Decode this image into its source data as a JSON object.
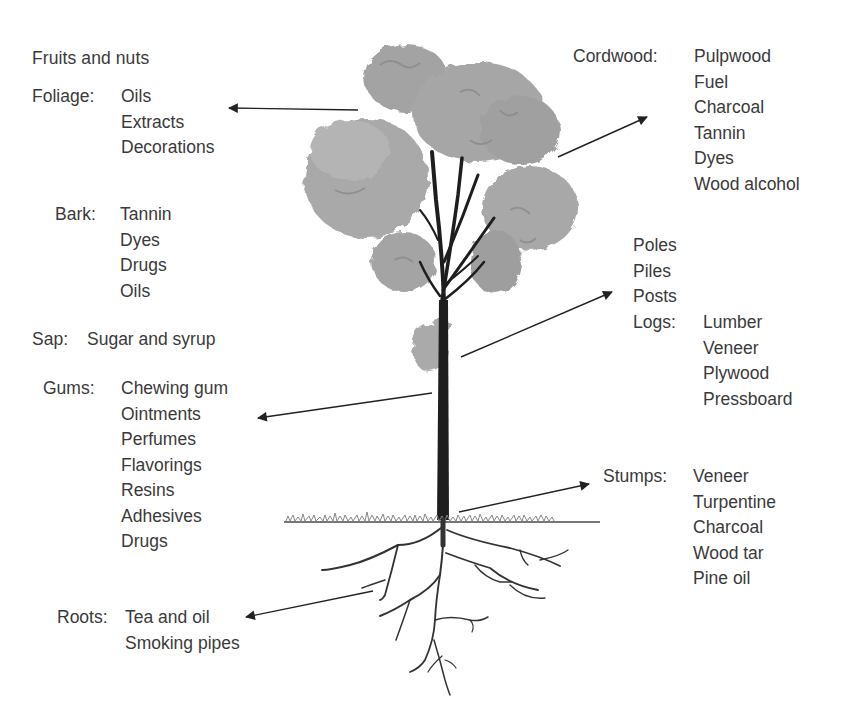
{
  "diagram": {
    "colors": {
      "text": "#3a3a3a",
      "foliage": "#a4a4a4",
      "foliage_dark": "#888888",
      "trunk": "#1e1e1e",
      "grass": "#777777",
      "arrow": "#222222"
    },
    "left": {
      "fruits": {
        "label": "Fruits and nuts"
      },
      "foliage": {
        "label": "Foliage:",
        "items": [
          "Oils",
          "Extracts",
          "Decorations"
        ]
      },
      "bark": {
        "label": "Bark:",
        "items": [
          "Tannin",
          "Dyes",
          "Drugs",
          "Oils"
        ]
      },
      "sap": {
        "label": "Sap:",
        "value": "Sugar and syrup"
      },
      "gums": {
        "label": "Gums:",
        "items": [
          "Chewing gum",
          "Ointments",
          "Perfumes",
          "Flavorings",
          "Resins",
          "Adhesives",
          "Drugs"
        ]
      },
      "roots": {
        "label": "Roots:",
        "items": [
          "Tea and oil",
          "Smoking pipes"
        ]
      }
    },
    "right": {
      "cordwood": {
        "label": "Cordwood:",
        "items": [
          "Pulpwood",
          "Fuel",
          "Charcoal",
          "Tannin",
          "Dyes",
          "Wood alcohol"
        ]
      },
      "trunk_products": {
        "items": [
          "Poles",
          "Piles",
          "Posts"
        ]
      },
      "logs": {
        "label": "Logs:",
        "items": [
          "Lumber",
          "Veneer",
          "Plywood",
          "Pressboard"
        ]
      },
      "stumps": {
        "label": "Stumps:",
        "items": [
          "Veneer",
          "Turpentine",
          "Charcoal",
          "Wood tar",
          "Pine oil"
        ]
      }
    },
    "arrows": [
      {
        "name": "foliage-arrow",
        "from": [
          358,
          110
        ],
        "to": [
          228,
          108
        ]
      },
      {
        "name": "cordwood-arrow",
        "from": [
          558,
          157
        ],
        "to": [
          648,
          117
        ]
      },
      {
        "name": "logs-arrow",
        "from": [
          461,
          357
        ],
        "to": [
          613,
          292
        ]
      },
      {
        "name": "gums-arrow",
        "from": [
          432,
          393
        ],
        "to": [
          257,
          418
        ]
      },
      {
        "name": "stumps-arrow",
        "from": [
          459,
          512
        ],
        "to": [
          590,
          484
        ]
      },
      {
        "name": "roots-arrow",
        "from": [
          373,
          591
        ],
        "to": [
          245,
          617
        ]
      }
    ]
  }
}
